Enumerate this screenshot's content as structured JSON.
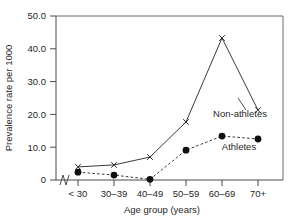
{
  "chart_data": {
    "type": "line",
    "title": "",
    "subtitle": "",
    "xlabel": "Age group (years)",
    "ylabel": "Prevalence rate per 1000",
    "categories": [
      "< 30",
      "30–39",
      "40–49",
      "50–59",
      "60–69",
      "70+"
    ],
    "ylim": [
      0,
      50
    ],
    "yticks": [
      0,
      10,
      20,
      30,
      40,
      50
    ],
    "ytick_labels": [
      "0",
      "10.0",
      "20.0",
      "30.0",
      "40.0",
      "50.0"
    ],
    "grid": false,
    "legend_position": "inline-annotation",
    "axis_break_x": true,
    "series": [
      {
        "name": "Non-athletes",
        "marker": "x",
        "line_style": "solid",
        "values": [
          4.0,
          4.6,
          7.0,
          17.7,
          43.3,
          21.3
        ]
      },
      {
        "name": "Athletes",
        "marker": "filled-circle",
        "line_style": "dashed",
        "values": [
          2.4,
          1.5,
          0.2,
          9.1,
          13.4,
          12.5
        ]
      }
    ],
    "annotations": [
      {
        "text": "Non-athletes",
        "series": "Non-athletes"
      },
      {
        "text": "Athletes",
        "series": "Athletes"
      }
    ]
  },
  "colors": {
    "background": "#ffffff",
    "axis": "#4a4a4a",
    "frame": "#6b6b6b",
    "series_line": "#3a3a3a",
    "marker": "#101010",
    "text": "#1f1f1f"
  }
}
